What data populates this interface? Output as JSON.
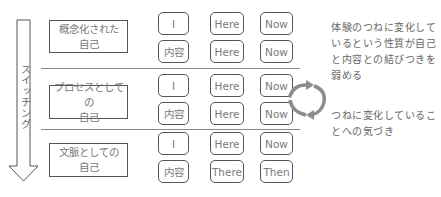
{
  "diagram": {
    "switch_arrow": {
      "label": "スイッチング",
      "direction": "down"
    },
    "rows": [
      {
        "label_line1": "概念化された",
        "label_line2": "自己",
        "tokens": [
          [
            "I",
            "Here",
            "Now"
          ],
          [
            "内容",
            "Here",
            "Now"
          ]
        ]
      },
      {
        "label_line1": "プロセスとしての",
        "label_line2": "自己",
        "tokens": [
          [
            "I",
            "Here",
            "Now"
          ],
          [
            "内容",
            "Here",
            "Now"
          ]
        ]
      },
      {
        "label_line1": "文脈としての",
        "label_line2": "自己",
        "tokens": [
          [
            "I",
            "Here",
            "Now"
          ],
          [
            "内容",
            "There",
            "Then"
          ]
        ]
      }
    ],
    "notes": {
      "top": "体験のつねに変化して\nいるという性質が自己\nと内容との結びつきを\n弱める",
      "bottom": "つねに変化しているこ\nとへの気づき"
    },
    "cycle_icon": "cycle-arrows-icon",
    "colors": {
      "line": "#555555",
      "separator": "#8a8a8a",
      "cycle_arrow": "#8c8c8c",
      "text": "#6a6a6a"
    }
  }
}
